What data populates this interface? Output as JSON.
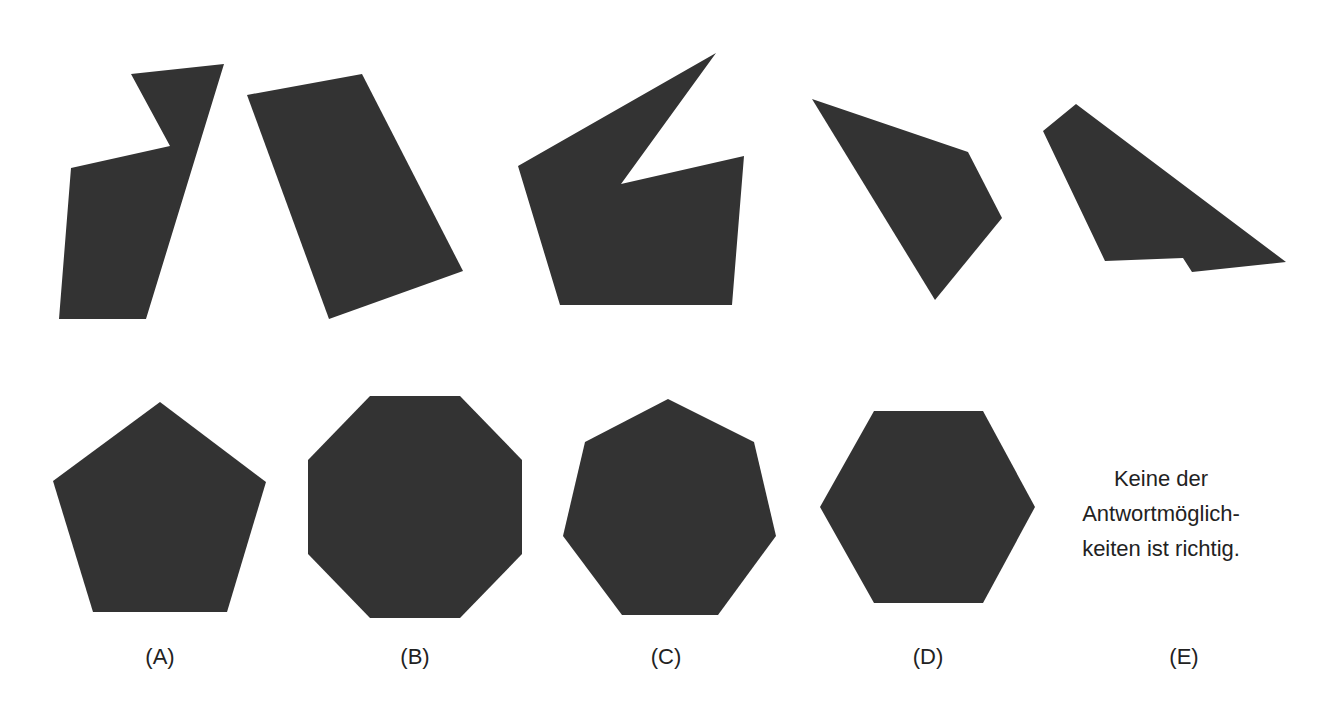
{
  "puzzle": {
    "colors": {
      "shape_fill": "#333333",
      "text": "#222222",
      "background": "#ffffff"
    },
    "pieces": [
      {
        "name": "piece-1",
        "points": "131,74 224,64 146,319 59,319 71,168 170,146"
      },
      {
        "name": "piece-2",
        "points": "247,95 362,74 463,271 329,319"
      },
      {
        "name": "piece-3",
        "points": "518,166 716,53 621,184 744,156 732,305 560,305"
      },
      {
        "name": "piece-4",
        "points": "812,99 968,152 1002,218 935,300"
      },
      {
        "name": "piece-5",
        "points": "1043,131 1076,104 1286,262 1192,272 1183,258 1105,261"
      }
    ],
    "options": [
      {
        "label": "(A)",
        "shape": "pentagon",
        "points": "160,402 266,482 227,612 93,612 53,481",
        "label_x": 160
      },
      {
        "label": "(B)",
        "shape": "octagon",
        "points": "370,396 460,396 522,460 522,554 460,618 370,618 308,554 308,460",
        "label_x": 415
      },
      {
        "label": "(C)",
        "shape": "heptagon",
        "points": "668,399 754,442 776,536 718,615 622,615 563,536 585,442",
        "label_x": 668
      },
      {
        "label": "(D)",
        "shape": "hexagon",
        "points": "874,411 983,411 1035,507 983,603 874,603 820,507",
        "label_x": 928
      },
      {
        "label": "(E)",
        "shape": "none",
        "label_x": 1184
      }
    ],
    "option_e_text": {
      "line1": "Keine der",
      "line2": "Antwortmöglich-",
      "line3": "keiten ist richtig."
    }
  }
}
